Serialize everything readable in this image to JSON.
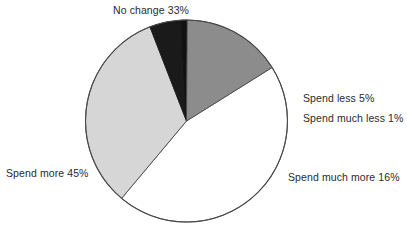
{
  "chart_data": {
    "type": "pie",
    "title": "",
    "subtitle": "",
    "xlabel": "",
    "ylabel": "",
    "legend_position": "none",
    "grid": false,
    "labels_inline": true,
    "total_percent": 100,
    "categories": [
      "Spend more",
      "No change",
      "Spend less",
      "Spend much less",
      "Spend much more"
    ],
    "values": [
      45,
      33,
      5,
      1,
      16
    ],
    "slices": [
      {
        "name": "spend-more",
        "label": "Spend more",
        "percent": 45,
        "label_text": "Spend more 45%",
        "fill": "#ffffff",
        "stroke": "#4a4a4a"
      },
      {
        "name": "no-change",
        "label": "No change",
        "percent": 33,
        "label_text": "No change 33%",
        "fill": "#d6d6d6",
        "stroke": "#4a4a4a"
      },
      {
        "name": "spend-less",
        "label": "Spend less",
        "percent": 5,
        "label_text": "Spend less 5%",
        "fill": "#1a1a1a",
        "stroke": "#1a1a1a"
      },
      {
        "name": "spend-much-less",
        "label": "Spend much less",
        "percent": 1,
        "label_text": "Spend much less 1%",
        "fill": "#111111",
        "stroke": "#111111"
      },
      {
        "name": "spend-much-more",
        "label": "Spend much more",
        "percent": 16,
        "label_text": "Spend much more 16%",
        "fill": "#8c8c8c",
        "stroke": "#4a4a4a"
      }
    ],
    "geometry": {
      "center_x": 186.5,
      "center_y": 121,
      "radius": 101
    },
    "colors": {
      "outline": "#4a4a4a",
      "text": "#2a2a2a",
      "background": "#ffffff"
    }
  }
}
